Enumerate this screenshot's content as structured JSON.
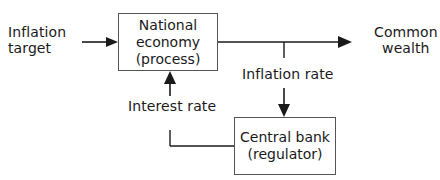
{
  "diagram": {
    "type": "feedback-control-block-diagram",
    "nodes": {
      "process": {
        "line1": "National",
        "line2": "economy",
        "line3": "(process)"
      },
      "regulator": {
        "line1": "Central bank",
        "line2": "(regulator)"
      }
    },
    "labels": {
      "input": {
        "line1": "Inflation",
        "line2": "target"
      },
      "output": {
        "line1": "Common",
        "line2": "wealth"
      },
      "feedback_measure": "Inflation rate",
      "control_signal": "Interest rate"
    },
    "edges": [
      {
        "from": "Inflation target",
        "to": "National economy (process)"
      },
      {
        "from": "National economy (process)",
        "to": "Common wealth"
      },
      {
        "from": "National economy (process)",
        "to": "Central bank (regulator)",
        "label": "Inflation rate"
      },
      {
        "from": "Central bank (regulator)",
        "to": "National economy (process)",
        "label": "Interest rate"
      }
    ],
    "colors": {
      "line": "#1a1a1a",
      "box_border": "#555555"
    }
  }
}
